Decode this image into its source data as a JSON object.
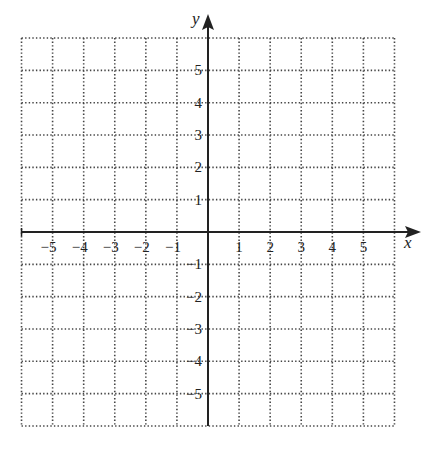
{
  "plane": {
    "x_min": -6,
    "x_max": 6,
    "y_min": -6,
    "y_max": 6,
    "origin_px": [
      208,
      232
    ],
    "unit_x_px": 31.08,
    "unit_y_px": 32.33,
    "grid_style": "dotted",
    "grid_color": "#444444",
    "axis_color": "#222222"
  },
  "axes": {
    "x_label": "x",
    "y_label": "y",
    "x_ticks": [
      {
        "v": -5,
        "label": "−5"
      },
      {
        "v": -4,
        "label": "−4"
      },
      {
        "v": -3,
        "label": "−3"
      },
      {
        "v": -2,
        "label": "−2"
      },
      {
        "v": -1,
        "label": "−1"
      },
      {
        "v": 1,
        "label": "1"
      },
      {
        "v": 2,
        "label": "2"
      },
      {
        "v": 3,
        "label": "3"
      },
      {
        "v": 4,
        "label": "4"
      },
      {
        "v": 5,
        "label": "5"
      }
    ],
    "y_ticks": [
      {
        "v": 5,
        "label": "5"
      },
      {
        "v": 4,
        "label": "4"
      },
      {
        "v": 3,
        "label": "3"
      },
      {
        "v": 2,
        "label": "2"
      },
      {
        "v": 1,
        "label": "1"
      },
      {
        "v": -1,
        "label": "−1"
      },
      {
        "v": -2,
        "label": "−2"
      },
      {
        "v": -3,
        "label": "−3"
      },
      {
        "v": -4,
        "label": "−4"
      },
      {
        "v": -5,
        "label": "−5"
      }
    ]
  }
}
